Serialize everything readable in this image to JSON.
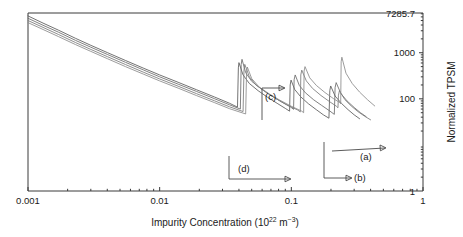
{
  "figure": {
    "title": "",
    "background_color": "#ffffff",
    "axis_color": "#3a3a3a"
  },
  "chart_data": {
    "type": "line",
    "title": "",
    "subtitle": "",
    "xlabel": "Impurity Concentration (10²² m⁻³)",
    "xlabel_parts": {
      "main": "Impurity Concentration (10",
      "exp1": "22",
      "mid": " m",
      "exp2": "−3",
      "tail": ")"
    },
    "ylabel": "Normalized TPSM",
    "xscale": "log",
    "yscale": "log",
    "xlim": [
      0.001,
      1
    ],
    "ylim": [
      1,
      7285.7
    ],
    "grid": false,
    "legend": "none",
    "xticks": [
      {
        "value": 0.001,
        "label": "0.001"
      },
      {
        "value": 0.01,
        "label": "0.01"
      },
      {
        "value": 0.1,
        "label": "0.1"
      },
      {
        "value": 1,
        "label": "1"
      }
    ],
    "yticks": [
      {
        "value": 7285.7,
        "label": "7285.7"
      },
      {
        "value": 1000,
        "label": "1000"
      },
      {
        "value": 100,
        "label": "100"
      },
      {
        "value": 1,
        "label": "1"
      }
    ],
    "y_axis_side": "right",
    "annotations": [
      {
        "id": "a",
        "label": "(a)",
        "x": 0.3,
        "y": 33,
        "arrow_dir": "right",
        "desc": "arrow pointing right along family of decaying tails"
      },
      {
        "id": "b",
        "label": "(b)",
        "x": 0.255,
        "y": 13,
        "arrow_dir": "right",
        "desc": "elbow arrow from lower peak cluster pointing right"
      },
      {
        "id": "c",
        "label": "(c)",
        "x": 0.055,
        "y": 460,
        "arrow_dir": "right",
        "desc": "elbow arrow rising from first peak cluster pointing right"
      },
      {
        "id": "d",
        "label": "(d)",
        "x": 0.052,
        "y": 9,
        "arrow_dir": "right",
        "desc": "elbow arrow at base of first peak cluster pointing right"
      }
    ],
    "series": [
      {
        "name": "curve-1",
        "color": "#5a5a5a",
        "description": "Monotonic power-law decay from 7285.7 at 0.001, with two resonant spike-and-decay events.",
        "spike_positions_x": [
          0.0395,
          0.098,
          0.196
        ],
        "points": [
          [
            0.001,
            6300
          ],
          [
            0.0013,
            4400
          ],
          [
            0.0017,
            3100
          ],
          [
            0.0023,
            2050
          ],
          [
            0.003,
            1450
          ],
          [
            0.004,
            1010
          ],
          [
            0.0055,
            680
          ],
          [
            0.0075,
            465
          ],
          [
            0.01,
            330
          ],
          [
            0.014,
            225
          ],
          [
            0.019,
            158
          ],
          [
            0.026,
            110
          ],
          [
            0.034,
            80
          ],
          [
            0.039,
            66
          ],
          [
            0.0396,
            470
          ],
          [
            0.04,
            610
          ],
          [
            0.043,
            330
          ],
          [
            0.048,
            215
          ],
          [
            0.056,
            150
          ],
          [
            0.066,
            108
          ],
          [
            0.078,
            80
          ],
          [
            0.09,
            62
          ],
          [
            0.097,
            54
          ],
          [
            0.098,
            200
          ],
          [
            0.0995,
            255
          ],
          [
            0.106,
            160
          ],
          [
            0.118,
            110
          ],
          [
            0.135,
            78
          ],
          [
            0.155,
            58
          ],
          [
            0.175,
            45
          ],
          [
            0.193,
            38
          ],
          [
            0.196,
            150
          ],
          [
            0.199,
            190
          ],
          [
            0.215,
            115
          ],
          [
            0.24,
            80
          ],
          [
            0.27,
            58
          ],
          [
            0.3,
            45
          ],
          [
            0.33,
            37
          ]
        ]
      },
      {
        "name": "curve-2",
        "color": "#6a6a6a",
        "description": "Second member of family, slightly shifted spikes to larger concentration.",
        "spike_positions_x": [
          0.0415,
          0.105,
          0.215
        ],
        "points": [
          [
            0.001,
            5600
          ],
          [
            0.0013,
            3950
          ],
          [
            0.0017,
            2800
          ],
          [
            0.0023,
            1850
          ],
          [
            0.003,
            1320
          ],
          [
            0.004,
            920
          ],
          [
            0.0055,
            620
          ],
          [
            0.0075,
            425
          ],
          [
            0.01,
            300
          ],
          [
            0.014,
            205
          ],
          [
            0.019,
            145
          ],
          [
            0.026,
            101
          ],
          [
            0.034,
            74
          ],
          [
            0.041,
            60
          ],
          [
            0.0416,
            560
          ],
          [
            0.0422,
            720
          ],
          [
            0.045,
            370
          ],
          [
            0.05,
            240
          ],
          [
            0.059,
            165
          ],
          [
            0.07,
            118
          ],
          [
            0.084,
            86
          ],
          [
            0.099,
            66
          ],
          [
            0.104,
            59
          ],
          [
            0.105,
            260
          ],
          [
            0.107,
            330
          ],
          [
            0.115,
            195
          ],
          [
            0.128,
            135
          ],
          [
            0.148,
            95
          ],
          [
            0.17,
            72
          ],
          [
            0.195,
            55
          ],
          [
            0.212,
            46
          ],
          [
            0.215,
            175
          ],
          [
            0.219,
            225
          ],
          [
            0.238,
            130
          ],
          [
            0.265,
            90
          ],
          [
            0.3,
            65
          ],
          [
            0.335,
            50
          ],
          [
            0.37,
            41
          ]
        ]
      },
      {
        "name": "curve-3",
        "color": "#7a7a7a",
        "description": "Third member of family.",
        "spike_positions_x": [
          0.0435,
          0.118,
          0.228
        ],
        "points": [
          [
            0.001,
            5000
          ],
          [
            0.0013,
            3550
          ],
          [
            0.0017,
            2500
          ],
          [
            0.0023,
            1660
          ],
          [
            0.003,
            1180
          ],
          [
            0.004,
            825
          ],
          [
            0.0055,
            555
          ],
          [
            0.0075,
            380
          ],
          [
            0.01,
            270
          ],
          [
            0.014,
            185
          ],
          [
            0.019,
            130
          ],
          [
            0.026,
            91
          ],
          [
            0.034,
            67
          ],
          [
            0.043,
            53
          ],
          [
            0.0437,
            430
          ],
          [
            0.0443,
            560
          ],
          [
            0.048,
            300
          ],
          [
            0.054,
            198
          ],
          [
            0.064,
            140
          ],
          [
            0.076,
            102
          ],
          [
            0.092,
            75
          ],
          [
            0.112,
            57
          ],
          [
            0.117,
            52
          ],
          [
            0.118,
            330
          ],
          [
            0.12,
            420
          ],
          [
            0.13,
            245
          ],
          [
            0.145,
            168
          ],
          [
            0.168,
            118
          ],
          [
            0.195,
            87
          ],
          [
            0.22,
            69
          ],
          [
            0.226,
            64
          ],
          [
            0.228,
            120
          ],
          [
            0.232,
            150
          ],
          [
            0.255,
            96
          ],
          [
            0.285,
            70
          ],
          [
            0.32,
            53
          ],
          [
            0.36,
            42
          ],
          [
            0.4,
            35
          ]
        ]
      },
      {
        "name": "curve-4",
        "color": "#8a8a8a",
        "description": "Fourth member of family, largest spike amplitude at last resonance.",
        "spike_positions_x": [
          0.0455,
          0.125,
          0.238
        ],
        "points": [
          [
            0.001,
            4500
          ],
          [
            0.0013,
            3200
          ],
          [
            0.0017,
            2250
          ],
          [
            0.0023,
            1500
          ],
          [
            0.003,
            1070
          ],
          [
            0.004,
            745
          ],
          [
            0.0055,
            500
          ],
          [
            0.0075,
            345
          ],
          [
            0.01,
            245
          ],
          [
            0.014,
            168
          ],
          [
            0.019,
            118
          ],
          [
            0.026,
            83
          ],
          [
            0.034,
            61
          ],
          [
            0.045,
            47
          ],
          [
            0.0457,
            380
          ],
          [
            0.0463,
            490
          ],
          [
            0.05,
            275
          ],
          [
            0.057,
            180
          ],
          [
            0.068,
            128
          ],
          [
            0.082,
            93
          ],
          [
            0.1,
            69
          ],
          [
            0.12,
            54
          ],
          [
            0.124,
            50
          ],
          [
            0.125,
            400
          ],
          [
            0.127,
            500
          ],
          [
            0.138,
            285
          ],
          [
            0.155,
            195
          ],
          [
            0.18,
            137
          ],
          [
            0.21,
            100
          ],
          [
            0.235,
            82
          ],
          [
            0.237,
            78
          ],
          [
            0.239,
            640
          ],
          [
            0.242,
            800
          ],
          [
            0.26,
            360
          ],
          [
            0.29,
            215
          ],
          [
            0.33,
            140
          ],
          [
            0.38,
            95
          ],
          [
            0.43,
            70
          ]
        ]
      }
    ]
  }
}
